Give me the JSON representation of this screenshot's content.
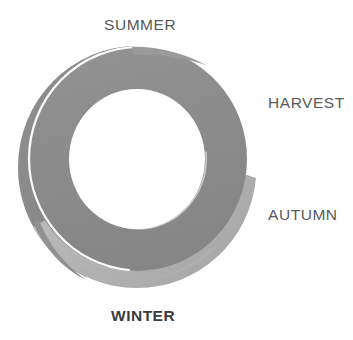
{
  "diagram": {
    "type": "cycle-spiral-ring",
    "title": "",
    "shape_name": "seasonal-cycle-ring",
    "labels": [
      {
        "id": "summer",
        "text": "SUMMER",
        "position": "top",
        "emphasis": false
      },
      {
        "id": "harvest",
        "text": "HARVEST",
        "position": "right-upper",
        "emphasis": false
      },
      {
        "id": "autumn",
        "text": "AUTUMN",
        "position": "right-lower",
        "emphasis": false
      },
      {
        "id": "winter",
        "text": "WINTER",
        "position": "bottom",
        "emphasis": true
      }
    ],
    "colors": {
      "background": "#ffffff",
      "band_main": "#8e8e8e",
      "band_shade_dark": "#7e7e7e",
      "band_edge_light": "#b3b3b3",
      "band_edge_lighter": "#c4c4c4",
      "seam": "#ffffff",
      "label_text": "#58595b",
      "label_text_emphasis": "#3b3c3e"
    }
  }
}
